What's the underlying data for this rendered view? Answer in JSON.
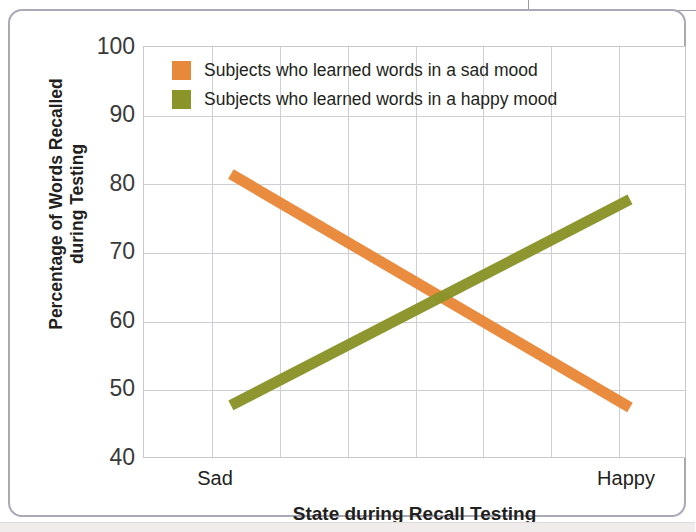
{
  "figure": {
    "frame_color": "#a9a9b8",
    "background": "#ffffff"
  },
  "chart_data": {
    "type": "line",
    "title": "",
    "subtitle": "",
    "xlabel": "State during Recall Testing",
    "ylabel": "Percentage of Words Recalled during Testing",
    "ylabel_line1": "Percentage of Words Recalled",
    "ylabel_line2": "during Testing",
    "x": [
      "Sad",
      "Happy"
    ],
    "categories": [
      "Sad",
      "Happy"
    ],
    "xticklabels": [
      "Sad",
      "Happy"
    ],
    "yticklabels": [
      "100",
      "90",
      "80",
      "70",
      "60",
      "50",
      "40"
    ],
    "ylim": [
      40,
      100
    ],
    "ytick_step": 10,
    "grid": "both",
    "grid_color": "#cfcfd3",
    "vertical_gridline_count": 7,
    "legend_position": "upper-left-inside",
    "series": [
      {
        "name": "Subjects who learned words in a sad mood",
        "color": "#e8883a",
        "values": [
          81.5,
          47.5
        ]
      },
      {
        "name": "Subjects who learned words in a happy mood",
        "color": "#8a9428",
        "values": [
          47.8,
          77.8
        ]
      }
    ],
    "crossover": {
      "x_fraction": 0.53,
      "value": 63.5
    },
    "annotations": []
  },
  "legend": {
    "items": [
      {
        "label": "Subjects who learned words in a sad mood",
        "color": "#e8883a",
        "swatch_name": "legend-swatch-sad-mood"
      },
      {
        "label": "Subjects who learned words in a happy mood",
        "color": "#8a9428",
        "swatch_name": "legend-swatch-happy-mood"
      }
    ]
  }
}
